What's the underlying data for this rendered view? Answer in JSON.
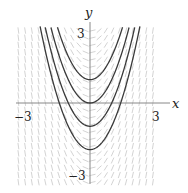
{
  "chart_data": {
    "type": "line",
    "title": "",
    "subtitle": "",
    "xlabel": "x",
    "ylabel": "y",
    "xlim": [
      -3.4,
      3.3
    ],
    "ylim": [
      -3.4,
      3.4
    ],
    "x_ticks": [
      {
        "value": -3,
        "label": "−3"
      },
      {
        "value": 3,
        "label": "3"
      }
    ],
    "y_ticks": [
      {
        "value": 3,
        "label": "3"
      },
      {
        "value": -3,
        "label": "−3"
      }
    ],
    "grid": false,
    "legend": null,
    "slope_field": {
      "equation": "dy/dx = 2x",
      "x_range": [
        -3.3,
        3.2
      ],
      "y_range": [
        -3.4,
        3.3
      ],
      "color": "#c8c8c8"
    },
    "series": [
      {
        "name": "C = 1",
        "formula": "y = x^2 + 1",
        "x": [
          -1.6,
          -1.2,
          -0.8,
          -0.4,
          0,
          0.4,
          0.8,
          1.2,
          1.6
        ],
        "values": [
          3.56,
          2.44,
          1.64,
          1.16,
          1.0,
          1.16,
          1.64,
          2.44,
          3.56
        ]
      },
      {
        "name": "C = 0",
        "formula": "y = x^2",
        "x": [
          -1.8,
          -1.2,
          -0.6,
          0,
          0.6,
          1.2,
          1.8
        ],
        "values": [
          3.24,
          1.44,
          0.36,
          0,
          0.36,
          1.44,
          3.24
        ]
      },
      {
        "name": "C = -1",
        "formula": "y = x^2 - 1",
        "x": [
          -2.0,
          -1.4,
          -0.8,
          0,
          0.8,
          1.4,
          2.0
        ],
        "values": [
          3.0,
          0.96,
          -0.36,
          -1.0,
          -0.36,
          0.96,
          3.0
        ]
      },
      {
        "name": "C = -2",
        "formula": "y = x^2 - 2",
        "x": [
          -2.2,
          -1.6,
          -0.8,
          0,
          0.8,
          1.6,
          2.2
        ],
        "values": [
          2.84,
          0.56,
          -1.36,
          -2.0,
          -1.36,
          0.56,
          2.84
        ]
      }
    ],
    "curve_color": "#3a3a3a",
    "axis_color": "#888888"
  }
}
